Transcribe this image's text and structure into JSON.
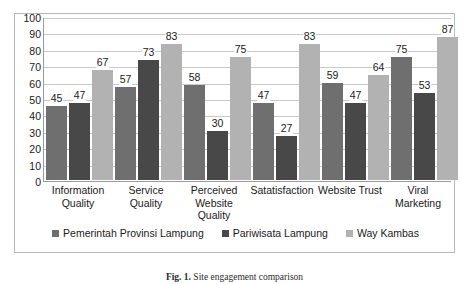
{
  "chart_data": {
    "type": "bar",
    "title": "",
    "xlabel": "",
    "ylabel": "",
    "ylim": [
      0,
      100
    ],
    "ytick_step": 10,
    "yticks": [
      100,
      90,
      80,
      70,
      60,
      50,
      40,
      30,
      20,
      10,
      0
    ],
    "grid": true,
    "legend_position": "bottom",
    "categories": [
      "Information Quality",
      "Service Quality",
      "Perceived Website Quality",
      "Satatisfaction",
      "Website Trust",
      "Viral Marketing"
    ],
    "category_lines": [
      [
        "Information",
        "Quality"
      ],
      [
        "Service",
        "Quality"
      ],
      [
        "Perceived",
        "Website",
        "Quality"
      ],
      [
        "Satatisfaction"
      ],
      [
        "Website Trust"
      ],
      [
        "Viral",
        "Marketing"
      ]
    ],
    "series": [
      {
        "name": "Pemerintah Provinsi Lampung",
        "color": "#6f6f6f",
        "values": [
          45,
          57,
          58,
          47,
          59,
          75
        ]
      },
      {
        "name": "Pariwisata Lampung",
        "color": "#484848",
        "values": [
          47,
          73,
          30,
          27,
          47,
          53
        ]
      },
      {
        "name": "Way Kambas",
        "color": "#b2b2b2",
        "values": [
          67,
          83,
          75,
          83,
          64,
          87
        ]
      }
    ]
  },
  "caption": {
    "label": "Fig. 1.",
    "text": "Site engagement comparison"
  },
  "icons": {
    "legend_marker": "filled-square"
  }
}
